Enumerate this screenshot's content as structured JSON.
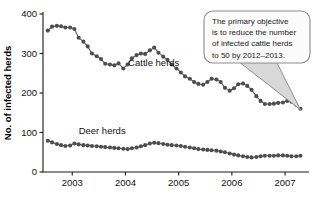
{
  "chart_data": {
    "type": "line",
    "title": "",
    "xlabel": "",
    "ylabel": "No. of infected herds",
    "xlim": [
      2002.45,
      2007.45
    ],
    "ylim": [
      0,
      400
    ],
    "yticks": [
      0,
      100,
      200,
      300,
      400
    ],
    "xticks": [
      2003,
      2004,
      2005,
      2006,
      2007
    ],
    "grid": false,
    "legend_position": "inline-annotation",
    "marker": "circle",
    "series": [
      {
        "name": "Cattle herds",
        "label_x": 2004.05,
        "label_y": 268,
        "color": "#4d4d4d",
        "x": [
          2002.54,
          2002.62,
          2002.71,
          2002.79,
          2002.87,
          2002.96,
          2003.04,
          2003.12,
          2003.21,
          2003.29,
          2003.37,
          2003.46,
          2003.54,
          2003.62,
          2003.71,
          2003.79,
          2003.87,
          2003.96,
          2004.04,
          2004.12,
          2004.21,
          2004.29,
          2004.37,
          2004.46,
          2004.54,
          2004.62,
          2004.71,
          2004.79,
          2004.87,
          2004.96,
          2005.04,
          2005.12,
          2005.21,
          2005.29,
          2005.37,
          2005.46,
          2005.54,
          2005.62,
          2005.71,
          2005.79,
          2005.87,
          2005.96,
          2006.04,
          2006.12,
          2006.21,
          2006.29,
          2006.37,
          2006.46,
          2006.54,
          2006.62,
          2006.71,
          2006.79,
          2006.87,
          2006.96,
          2007.04,
          2007.12,
          2007.21,
          2007.29
        ],
        "y": [
          358,
          368,
          370,
          369,
          366,
          366,
          362,
          340,
          330,
          318,
          300,
          293,
          286,
          274,
          272,
          270,
          275,
          262,
          272,
          288,
          296,
          300,
          299,
          308,
          315,
          302,
          292,
          284,
          272,
          262,
          252,
          242,
          236,
          228,
          223,
          221,
          228,
          236,
          234,
          228,
          213,
          206,
          212,
          222,
          224,
          218,
          208,
          192,
          180,
          172,
          172,
          173,
          175,
          176,
          180,
          178,
          170,
          160
        ]
      },
      {
        "name": "Deer herds",
        "label_x": 2003.12,
        "label_y": 96,
        "color": "#4d4d4d",
        "x": [
          2002.54,
          2002.62,
          2002.71,
          2002.79,
          2002.87,
          2002.96,
          2003.04,
          2003.12,
          2003.21,
          2003.29,
          2003.37,
          2003.46,
          2003.54,
          2003.62,
          2003.71,
          2003.79,
          2003.87,
          2003.96,
          2004.04,
          2004.12,
          2004.21,
          2004.29,
          2004.37,
          2004.46,
          2004.54,
          2004.62,
          2004.71,
          2004.79,
          2004.87,
          2004.96,
          2005.04,
          2005.12,
          2005.21,
          2005.29,
          2005.37,
          2005.46,
          2005.54,
          2005.62,
          2005.71,
          2005.79,
          2005.87,
          2005.96,
          2006.04,
          2006.12,
          2006.21,
          2006.29,
          2006.37,
          2006.46,
          2006.54,
          2006.62,
          2006.71,
          2006.79,
          2006.87,
          2006.96,
          2007.04,
          2007.12,
          2007.21,
          2007.29
        ],
        "y": [
          79,
          75,
          71,
          68,
          66,
          67,
          72,
          70,
          68,
          67,
          66,
          65,
          64,
          63,
          62,
          61,
          60,
          59,
          58,
          60,
          62,
          65,
          68,
          72,
          74,
          73,
          71,
          69,
          68,
          67,
          66,
          64,
          62,
          60,
          58,
          57,
          56,
          55,
          54,
          52,
          50,
          47,
          44,
          42,
          40,
          38,
          37,
          38,
          40,
          41,
          41,
          41,
          42,
          42,
          41,
          40,
          40,
          41
        ]
      }
    ],
    "annotation": {
      "text": "The primary objective is to reduce the number of infected cattle herds to 50 by 2012–2013.",
      "lines": [
        "The primary objective",
        "is to reduce the number",
        "of infected cattle herds",
        "to 50 by 2012–2013."
      ],
      "target_x": 2007.29,
      "target_y": 160
    }
  }
}
